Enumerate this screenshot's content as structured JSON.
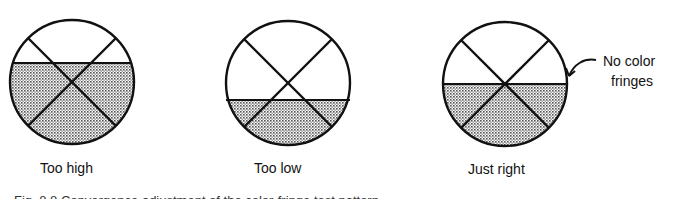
{
  "figure": {
    "panels": [
      {
        "id": "too-high",
        "label": "Too high",
        "cx": 72,
        "cy": 82,
        "r": 62,
        "level_y": 63
      },
      {
        "id": "too-low",
        "label": "Too low",
        "cx": 288,
        "cy": 83,
        "r": 62,
        "level_y": 100
      },
      {
        "id": "just-right",
        "label": "Just right",
        "cx": 505,
        "cy": 84,
        "r": 62,
        "level_y": 84
      }
    ],
    "annotation": {
      "line1": "No color",
      "line2": "fringes"
    },
    "caption": "Fig. 8.8 Convergence adjustment of the color-fringe test pattern"
  },
  "colors": {
    "stroke": "#111111",
    "shade": "#9a9a9a",
    "background": "#ffffff"
  }
}
